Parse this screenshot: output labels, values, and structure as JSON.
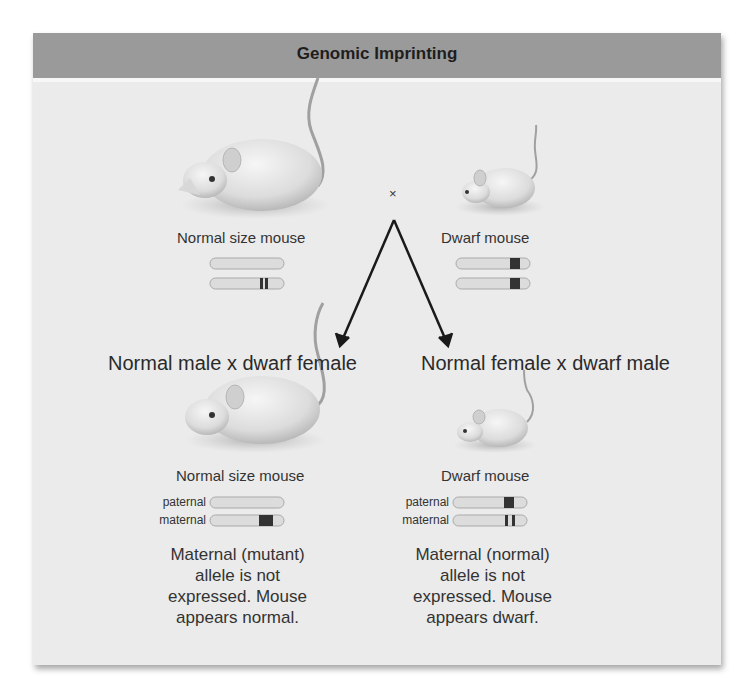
{
  "title": "Genomic Imprinting",
  "parents": {
    "left": {
      "label": "Normal size mouse",
      "chromosomes": [
        "normal",
        "mutant"
      ]
    },
    "right": {
      "label": "Dwarf mouse",
      "chromosomes": [
        "mutant",
        "mutant"
      ]
    },
    "cross_symbol": "×"
  },
  "crosses": {
    "left": {
      "title": "Normal male x dwarf female",
      "offspring_label": "Normal size mouse",
      "paternal_label": "paternal",
      "maternal_label": "maternal",
      "description": [
        "Maternal (mutant)",
        "allele is not",
        "expressed. Mouse",
        "appears normal."
      ]
    },
    "right": {
      "title": "Normal female x dwarf male",
      "offspring_label": "Dwarf mouse",
      "paternal_label": "paternal",
      "maternal_label": "maternal",
      "description": [
        "Maternal (normal)",
        "allele is not",
        "expressed. Mouse",
        "appears dwarf."
      ]
    }
  },
  "colors": {
    "header_bg": "#9a9a9a",
    "panel_bg": "#ebebeb",
    "chromosome": "#dcdcdc",
    "band": "#333333"
  }
}
